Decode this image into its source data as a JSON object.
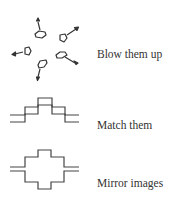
{
  "items": [
    {
      "label": "Blow them up",
      "icon": "explode-icon"
    },
    {
      "label": "Match them",
      "icon": "stair-match-icon"
    },
    {
      "label": "Mirror images",
      "icon": "mirror-cross-icon"
    }
  ],
  "colors": {
    "stroke": "#333333",
    "text": "#333333",
    "background": "#ffffff"
  }
}
